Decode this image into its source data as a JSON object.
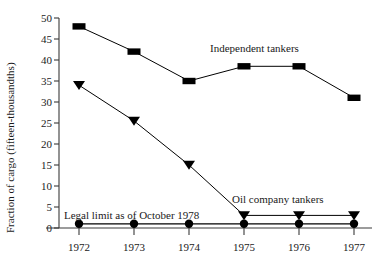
{
  "chart_data": {
    "type": "line",
    "title": "",
    "xlabel": "",
    "ylabel": "Fraction of cargo (fifteen-thousandths)",
    "categories": [
      "1972",
      "1973",
      "1974",
      "1975",
      "1976",
      "1977"
    ],
    "x": [
      1972,
      1973,
      1974,
      1975,
      1976,
      1977
    ],
    "xlim": [
      1971.6,
      1977.6
    ],
    "ylim": [
      0,
      50
    ],
    "yticks": [
      0,
      5,
      10,
      15,
      20,
      25,
      30,
      35,
      40,
      45,
      50
    ],
    "ytick_labels": [
      "0",
      "5",
      "10",
      "15",
      "20",
      "25",
      "30",
      "35",
      "40",
      "45",
      "50"
    ],
    "grid": false,
    "legend_position": "inline-annotations",
    "series": [
      {
        "name": "Independent tankers",
        "marker": "square",
        "color": "#000000",
        "values": [
          48,
          42,
          35,
          38.5,
          38.5,
          31
        ]
      },
      {
        "name": "Oil company tankers",
        "marker": "triangle-down",
        "color": "#000000",
        "values": [
          34,
          25.5,
          15,
          3,
          3,
          3
        ]
      },
      {
        "name": "Legal limit as of October 1978",
        "marker": "circle",
        "color": "#000000",
        "values": [
          1,
          1,
          1,
          1,
          1,
          1
        ]
      }
    ],
    "annotations": [
      {
        "text": "Independent tankers",
        "x": 1975.0,
        "y": 41.5
      },
      {
        "text": "Oil company tankers",
        "x": 1976.05,
        "y": 6.2
      },
      {
        "text": "Legal limit as of October 1978",
        "x": 1973.45,
        "y": 4.2
      }
    ]
  },
  "axis": {
    "y_title": "Fraction of cargo (fifteen-thousandths)",
    "y_ticks": [
      "50",
      "45",
      "40",
      "35",
      "30",
      "25",
      "20",
      "15",
      "10",
      "5",
      "0"
    ],
    "x_ticks": [
      "1972",
      "1973",
      "1974",
      "1975",
      "1976",
      "1977"
    ]
  },
  "labels": {
    "independent": "Independent tankers",
    "oil_company": "Oil company tankers",
    "legal_limit": "Legal limit as of October 1978"
  }
}
